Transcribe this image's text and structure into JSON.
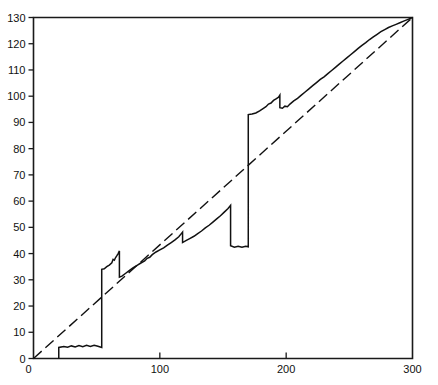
{
  "chart_data": {
    "type": "line",
    "title": "",
    "subtitle": "",
    "xlabel": "",
    "ylabel": "",
    "xlim": [
      0,
      300
    ],
    "ylim": [
      0,
      130
    ],
    "grid": false,
    "legend": "none",
    "x_ticks": [
      0,
      100,
      200,
      300
    ],
    "x_tick_labels": [
      "0",
      "100",
      "200",
      "300"
    ],
    "x_minor_ticks": [],
    "y_ticks": [
      0,
      10,
      20,
      30,
      40,
      50,
      60,
      70,
      80,
      90,
      100,
      110,
      120,
      130
    ],
    "y_tick_labels": [
      "0",
      "10",
      "20",
      "30",
      "40",
      "50",
      "60",
      "70",
      "80",
      "90",
      "100",
      "110",
      "120",
      "130"
    ],
    "annotations": [],
    "series": [
      {
        "name": "step-curve",
        "style": "solid",
        "color": "#111111",
        "points": [
          [
            20,
            0
          ],
          [
            20,
            4.2
          ],
          [
            24,
            4.6
          ],
          [
            27,
            4.3
          ],
          [
            30,
            4.8
          ],
          [
            33,
            4.4
          ],
          [
            36,
            4.9
          ],
          [
            39,
            4.5
          ],
          [
            42,
            5.0
          ],
          [
            45,
            4.6
          ],
          [
            48,
            5.0
          ],
          [
            51,
            4.7
          ],
          [
            54,
            4.2
          ],
          [
            54,
            34.0
          ],
          [
            56,
            34.2
          ],
          [
            58,
            35.0
          ],
          [
            60,
            35.6
          ],
          [
            62,
            36.5
          ],
          [
            63,
            37.8
          ],
          [
            64,
            37.5
          ],
          [
            65,
            38.5
          ],
          [
            66,
            39.2
          ],
          [
            67,
            40.0
          ],
          [
            68,
            41.0
          ],
          [
            68,
            31.0
          ],
          [
            70,
            31.4
          ],
          [
            73,
            32.5
          ],
          [
            76,
            33.6
          ],
          [
            79,
            34.6
          ],
          [
            82,
            35.5
          ],
          [
            85,
            36.4
          ],
          [
            88,
            37.2
          ],
          [
            90,
            38.2
          ],
          [
            92,
            38.6
          ],
          [
            94,
            39.6
          ],
          [
            97,
            40.6
          ],
          [
            100,
            41.4
          ],
          [
            103,
            42.2
          ],
          [
            106,
            43.2
          ],
          [
            109,
            44.2
          ],
          [
            112,
            45.2
          ],
          [
            115,
            46.4
          ],
          [
            117,
            47.6
          ],
          [
            118,
            48.2
          ],
          [
            118,
            44.2
          ],
          [
            121,
            45.0
          ],
          [
            124,
            45.8
          ],
          [
            127,
            46.6
          ],
          [
            130,
            47.6
          ],
          [
            133,
            48.6
          ],
          [
            136,
            49.8
          ],
          [
            139,
            50.8
          ],
          [
            142,
            52.0
          ],
          [
            145,
            53.2
          ],
          [
            148,
            54.4
          ],
          [
            151,
            55.8
          ],
          [
            154,
            57.2
          ],
          [
            156,
            58.4
          ],
          [
            156,
            43.0
          ],
          [
            159,
            42.4
          ],
          [
            162,
            42.8
          ],
          [
            165,
            42.4
          ],
          [
            168,
            42.8
          ],
          [
            170,
            42.6
          ],
          [
            170,
            93.0
          ],
          [
            173,
            93.2
          ],
          [
            176,
            93.6
          ],
          [
            179,
            94.4
          ],
          [
            182,
            95.4
          ],
          [
            184,
            96.0
          ],
          [
            186,
            97.0
          ],
          [
            188,
            97.4
          ],
          [
            190,
            98.4
          ],
          [
            192,
            99.0
          ],
          [
            194,
            99.6
          ],
          [
            195,
            100.4
          ],
          [
            195,
            95.6
          ],
          [
            197,
            95.4
          ],
          [
            199,
            96.2
          ],
          [
            201,
            96.0
          ],
          [
            203,
            97.0
          ],
          [
            206,
            98.2
          ],
          [
            209,
            99.2
          ],
          [
            212,
            100.4
          ],
          [
            215,
            101.6
          ],
          [
            218,
            102.8
          ],
          [
            221,
            104.0
          ],
          [
            224,
            105.2
          ],
          [
            227,
            106.4
          ],
          [
            230,
            107.4
          ],
          [
            233,
            108.6
          ],
          [
            236,
            109.8
          ],
          [
            239,
            111.0
          ],
          [
            242,
            112.2
          ],
          [
            245,
            113.4
          ],
          [
            248,
            114.6
          ],
          [
            251,
            115.8
          ],
          [
            254,
            117.0
          ],
          [
            257,
            118.2
          ],
          [
            260,
            119.4
          ],
          [
            263,
            120.4
          ],
          [
            266,
            121.6
          ],
          [
            269,
            122.6
          ],
          [
            272,
            123.6
          ],
          [
            275,
            124.6
          ],
          [
            278,
            125.4
          ],
          [
            281,
            126.2
          ],
          [
            284,
            126.8
          ],
          [
            287,
            127.4
          ],
          [
            290,
            128.0
          ],
          [
            293,
            128.6
          ],
          [
            296,
            129.2
          ],
          [
            300,
            130.0
          ]
        ]
      },
      {
        "name": "reference-line",
        "style": "dashed",
        "color": "#111111",
        "points": [
          [
            0,
            0
          ],
          [
            300,
            130
          ]
        ]
      }
    ]
  },
  "axes": {
    "frame_color": "#1a1a1a"
  }
}
